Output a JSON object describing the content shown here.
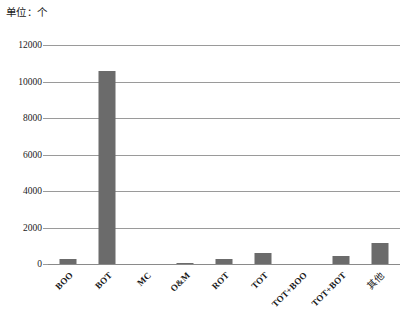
{
  "unit_caption": "单位：个",
  "chart_data": {
    "type": "bar",
    "title": "",
    "subtitle": "",
    "xlabel": "",
    "ylabel": "单位：个",
    "ylim": [
      0,
      12000
    ],
    "yticks": [
      0,
      2000,
      4000,
      6000,
      8000,
      10000,
      12000
    ],
    "ytick_labels": [
      "0",
      "2000",
      "4000",
      "6000",
      "8000",
      "10000",
      "12000"
    ],
    "grid": true,
    "legend": false,
    "legend_position": "none",
    "bar_color": "#6b6b6b",
    "gridline_color": "#9a9a9a",
    "background_color": "#ffffff",
    "categories": [
      "BOO",
      "BOT",
      "MC",
      "O&M",
      "ROT",
      "TOT",
      "TOT+BOO",
      "TOT+BOT",
      "其他"
    ],
    "values": [
      280,
      10550,
      0,
      60,
      280,
      600,
      0,
      450,
      1150
    ],
    "series": [
      {
        "name": "项目数量",
        "values": [
          280,
          10550,
          0,
          60,
          280,
          600,
          0,
          450,
          1150
        ]
      }
    ]
  }
}
